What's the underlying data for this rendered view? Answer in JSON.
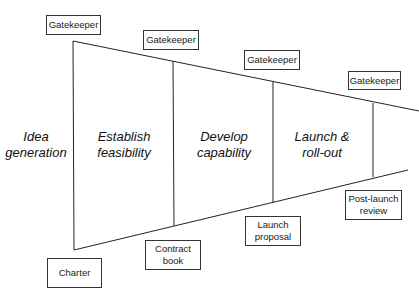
{
  "diagram": {
    "stages": [
      {
        "line1": "Idea",
        "line2": "generation"
      },
      {
        "line1": "Establish",
        "line2": "feasibility"
      },
      {
        "line1": "Develop",
        "line2": "capability"
      },
      {
        "line1": "Launch &",
        "line2": "roll-out"
      }
    ],
    "gatekeepers": [
      "Gatekeeper",
      "Gatekeeper",
      "Gatekeeper",
      "Gatekeeper"
    ],
    "deliverables": [
      {
        "line1": "Charter",
        "line2": ""
      },
      {
        "line1": "Contract",
        "line2": "book"
      },
      {
        "line1": "Launch",
        "line2": "proposal"
      },
      {
        "line1": "Post-launch",
        "line2": "review"
      }
    ]
  }
}
